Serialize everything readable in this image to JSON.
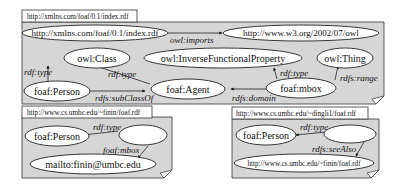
{
  "graphs": [
    {
      "title": "http://xmlns.com/foaf/0.1/index.rdf",
      "nodes": {
        "doc": "http://xmlns.com/foaf/0.1/index.rdf",
        "owl": "http://www.w3.org/2002/07/owl",
        "owl_class": "owl:Class",
        "ifp": "owl:InverseFunctionalProperty",
        "thing": "owl:Thing",
        "person": "foaf:Person",
        "agent": "foaf:Agent",
        "mbox": "foaf:mbox"
      },
      "edges": {
        "imports": "owl:imports",
        "person_type": "rdf:type",
        "agent_type": "rdf:type",
        "mbox_type": "rdf:type",
        "subclass": "rdfs:subClassOf",
        "domain": "rdfs:domain",
        "range": "rdfs:range"
      }
    },
    {
      "title": "http://www.cs.umbc.edu/~finin/foaf.rdf",
      "nodes": {
        "person": "foaf:Person",
        "blank": "",
        "mailto": "mailto:finin@umbc.edu"
      },
      "edges": {
        "type": "rdf:type",
        "mbox": "foaf:mbox"
      }
    },
    {
      "title": "http://www.cs.umbc.edu/~dingli1/foaf.rdf",
      "nodes": {
        "person": "foaf:Person",
        "blank": "",
        "seealso_target": "http://www.cs.umbc.edu/~finin/foaf.rdf"
      },
      "edges": {
        "type": "rdf:type",
        "seealso": "rdfs:seeAlso"
      }
    }
  ]
}
